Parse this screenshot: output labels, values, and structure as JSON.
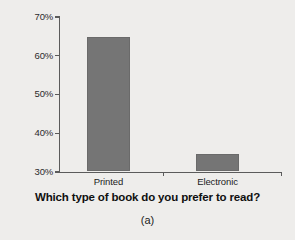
{
  "chart_data": {
    "type": "bar",
    "title": "",
    "subtitle": "",
    "xlabel": "Which type of book do you prefer to read?",
    "ylabel": "",
    "categories": [
      "Printed",
      "Electronic"
    ],
    "values": [
      64.7,
      34.5
    ],
    "series": [
      {
        "name": "Preference",
        "values": [
          64.7,
          34.5
        ]
      }
    ],
    "ylim": [
      30,
      70
    ],
    "ytick_labels": [
      "30%",
      "40%",
      "50%",
      "60%",
      "70%"
    ],
    "ytick_values": [
      30,
      40,
      50,
      60,
      70
    ],
    "grid": false,
    "legend": false,
    "legend_position": "none",
    "annotations": [
      "(a)"
    ],
    "bar_color": "#757575",
    "background_color": "#eeedeb",
    "axis_color": "#5b5b5b"
  },
  "caption": {
    "text": "(a)"
  },
  "axes": {
    "x_title": "Which type of book do you prefer to read?"
  }
}
